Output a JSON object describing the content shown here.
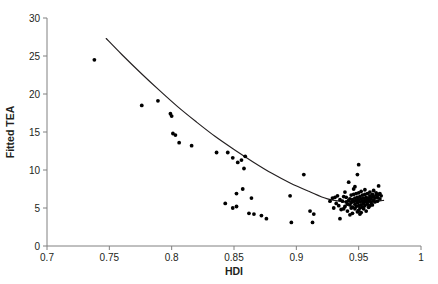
{
  "chart_data": {
    "type": "scatter",
    "title": "",
    "xlabel": "HDI",
    "ylabel": "Fitted TEA",
    "xlim": [
      0.7,
      1.0
    ],
    "ylim": [
      0,
      30
    ],
    "xticks": [
      "0.7",
      "0.75",
      "0.8",
      "0.85",
      "0.9",
      "0.95",
      "1"
    ],
    "xtick_values": [
      0.7,
      0.75,
      0.8,
      0.85,
      0.9,
      0.95,
      1.0
    ],
    "yticks": [
      "0",
      "5",
      "10",
      "15",
      "20",
      "25",
      "30"
    ],
    "ytick_values": [
      0,
      5,
      10,
      15,
      20,
      25,
      30
    ],
    "grid": false,
    "legend": "none",
    "marker_color": "#000000",
    "curve_color": "#231f20",
    "axis_color": "#808080",
    "series": [
      {
        "name": "Observed TEA",
        "type": "scatter",
        "points": [
          [
            0.738,
            24.5
          ],
          [
            0.776,
            18.5
          ],
          [
            0.789,
            19.1
          ],
          [
            0.799,
            17.4
          ],
          [
            0.8,
            17.1
          ],
          [
            0.801,
            14.8
          ],
          [
            0.803,
            14.6
          ],
          [
            0.806,
            13.6
          ],
          [
            0.816,
            13.2
          ],
          [
            0.836,
            12.3
          ],
          [
            0.845,
            12.3
          ],
          [
            0.843,
            5.6
          ],
          [
            0.849,
            11.6
          ],
          [
            0.853,
            11.0
          ],
          [
            0.856,
            11.3
          ],
          [
            0.859,
            11.8
          ],
          [
            0.858,
            10.2
          ],
          [
            0.852,
            6.9
          ],
          [
            0.857,
            7.5
          ],
          [
            0.852,
            5.2
          ],
          [
            0.849,
            5.0
          ],
          [
            0.864,
            6.3
          ],
          [
            0.862,
            4.3
          ],
          [
            0.866,
            4.2
          ],
          [
            0.872,
            4.0
          ],
          [
            0.876,
            3.6
          ],
          [
            0.895,
            6.6
          ],
          [
            0.896,
            3.1
          ],
          [
            0.906,
            9.4
          ],
          [
            0.911,
            4.6
          ],
          [
            0.914,
            4.2
          ],
          [
            0.913,
            3.1
          ],
          [
            0.927,
            5.9
          ],
          [
            0.929,
            6.3
          ],
          [
            0.931,
            6.4
          ],
          [
            0.932,
            5.6
          ],
          [
            0.933,
            6.6
          ],
          [
            0.934,
            5.3
          ],
          [
            0.935,
            6.1
          ],
          [
            0.936,
            4.8
          ],
          [
            0.935,
            3.6
          ],
          [
            0.937,
            5.9
          ],
          [
            0.938,
            6.5
          ],
          [
            0.939,
            7.1
          ],
          [
            0.94,
            5.8
          ],
          [
            0.94,
            6.4
          ],
          [
            0.941,
            5.5
          ],
          [
            0.941,
            4.6
          ],
          [
            0.942,
            6.0
          ],
          [
            0.942,
            8.4
          ],
          [
            0.943,
            6.2
          ],
          [
            0.943,
            5.4
          ],
          [
            0.944,
            5.7
          ],
          [
            0.944,
            6.7
          ],
          [
            0.945,
            5.1
          ],
          [
            0.945,
            6.1
          ],
          [
            0.945,
            4.3
          ],
          [
            0.946,
            5.9
          ],
          [
            0.946,
            6.8
          ],
          [
            0.946,
            7.5
          ],
          [
            0.947,
            5.5
          ],
          [
            0.947,
            6.3
          ],
          [
            0.947,
            4.9
          ],
          [
            0.948,
            5.2
          ],
          [
            0.948,
            6.0
          ],
          [
            0.948,
            6.9
          ],
          [
            0.949,
            5.7
          ],
          [
            0.949,
            4.5
          ],
          [
            0.949,
            6.4
          ],
          [
            0.949,
            9.4
          ],
          [
            0.95,
            10.7
          ],
          [
            0.95,
            5.3
          ],
          [
            0.95,
            6.1
          ],
          [
            0.95,
            7.0
          ],
          [
            0.95,
            4.7
          ],
          [
            0.951,
            5.8
          ],
          [
            0.951,
            6.5
          ],
          [
            0.951,
            5.0
          ],
          [
            0.952,
            6.2
          ],
          [
            0.952,
            5.4
          ],
          [
            0.952,
            7.2
          ],
          [
            0.952,
            4.4
          ],
          [
            0.953,
            5.9
          ],
          [
            0.953,
            6.7
          ],
          [
            0.953,
            5.1
          ],
          [
            0.954,
            6.3
          ],
          [
            0.954,
            5.6
          ],
          [
            0.954,
            4.9
          ],
          [
            0.955,
            6.0
          ],
          [
            0.955,
            6.8
          ],
          [
            0.955,
            5.3
          ],
          [
            0.955,
            7.4
          ],
          [
            0.956,
            5.8
          ],
          [
            0.956,
            6.4
          ],
          [
            0.956,
            4.6
          ],
          [
            0.957,
            6.1
          ],
          [
            0.957,
            5.5
          ],
          [
            0.957,
            6.9
          ],
          [
            0.958,
            6.3
          ],
          [
            0.958,
            5.9
          ],
          [
            0.958,
            5.1
          ],
          [
            0.959,
            6.6
          ],
          [
            0.959,
            6.0
          ],
          [
            0.959,
            7.1
          ],
          [
            0.96,
            6.4
          ],
          [
            0.96,
            5.7
          ],
          [
            0.96,
            6.2
          ],
          [
            0.961,
            6.8
          ],
          [
            0.961,
            5.4
          ],
          [
            0.962,
            6.5
          ],
          [
            0.962,
            7.3
          ],
          [
            0.962,
            6.0
          ],
          [
            0.963,
            6.3
          ],
          [
            0.963,
            5.8
          ],
          [
            0.964,
            6.7
          ],
          [
            0.964,
            7.0
          ],
          [
            0.965,
            6.4
          ],
          [
            0.965,
            5.9
          ],
          [
            0.966,
            6.8
          ],
          [
            0.966,
            7.9
          ],
          [
            0.967,
            6.9
          ],
          [
            0.967,
            6.2
          ],
          [
            0.968,
            6.6
          ],
          [
            0.944,
            5.0
          ],
          [
            0.938,
            4.9
          ],
          [
            0.951,
            4.2
          ],
          [
            0.943,
            4.1
          ],
          [
            0.939,
            5.2
          ],
          [
            0.93,
            5.0
          ],
          [
            0.947,
            7.8
          ],
          [
            0.959,
            5.3
          ]
        ]
      },
      {
        "name": "Fitted quadratic curve",
        "type": "line",
        "points": [
          [
            0.7475,
            27.3
          ],
          [
            0.76,
            25.2
          ],
          [
            0.775,
            22.8
          ],
          [
            0.79,
            20.5
          ],
          [
            0.805,
            18.3
          ],
          [
            0.82,
            16.3
          ],
          [
            0.835,
            14.4
          ],
          [
            0.85,
            12.7
          ],
          [
            0.865,
            11.1
          ],
          [
            0.88,
            9.6
          ],
          [
            0.895,
            8.3
          ],
          [
            0.91,
            7.2
          ],
          [
            0.925,
            6.2
          ],
          [
            0.94,
            5.8
          ],
          [
            0.955,
            5.8
          ],
          [
            0.965,
            5.9
          ],
          [
            0.97,
            6.0
          ]
        ]
      }
    ]
  }
}
